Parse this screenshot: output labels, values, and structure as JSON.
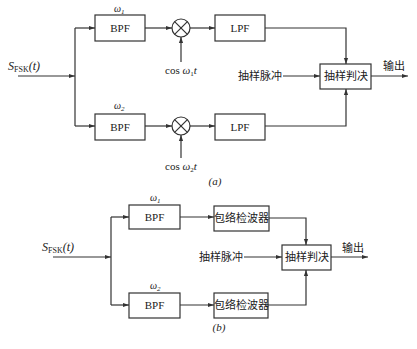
{
  "diagram_a": {
    "caption": "(a)",
    "input_label_main": "S",
    "input_label_sub": "FSK",
    "input_label_arg": "(t)",
    "upper": {
      "freq_label": "ω",
      "freq_sub": "1",
      "bpf": "BPF",
      "lpf": "LPF",
      "carrier_prefix": "cos ",
      "carrier_omega": "ω",
      "carrier_sub": "1",
      "carrier_t": "t"
    },
    "lower": {
      "freq_label": "ω",
      "freq_sub": "2",
      "bpf": "BPF",
      "lpf": "LPF",
      "carrier_prefix": "cos ",
      "carrier_omega": "ω",
      "carrier_sub": "2",
      "carrier_t": "t"
    },
    "sampling_pulse": "抽样脉冲",
    "decision": "抽样判决",
    "output": "输出"
  },
  "diagram_b": {
    "caption": "(b)",
    "input_label_main": "S",
    "input_label_sub": "FSK",
    "input_label_arg": "(t)",
    "upper": {
      "freq_label": "ω",
      "freq_sub": "1",
      "bpf": "BPF",
      "detector": "包络检波器"
    },
    "lower": {
      "freq_label": "ω",
      "freq_sub": "2",
      "bpf": "BPF",
      "detector": "包络检波器"
    },
    "sampling_pulse": "抽样脉冲",
    "decision": "抽样判决",
    "output": "输出"
  }
}
